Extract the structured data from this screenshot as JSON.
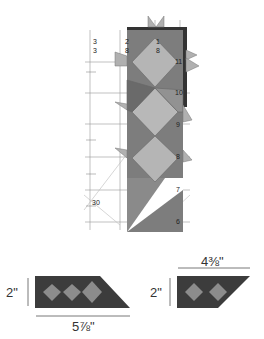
{
  "ruler": {
    "top_labels": [
      "3",
      "3",
      "2",
      "8",
      "1",
      "8"
    ],
    "scale_labels": [
      "11",
      "10",
      "9",
      "8",
      "7",
      "6"
    ],
    "angle_label": "30"
  },
  "piece_left": {
    "height_label": "2\"",
    "width_label": "5⅞\""
  },
  "piece_right": {
    "height_label": "2\"",
    "width_label": "4⅜\""
  },
  "colors": {
    "dark": "#3a3a3a",
    "mid": "#5c5c5c",
    "light": "#9a9a9a",
    "strip": "#7a7a7a",
    "strip_light": "#b8b8b8"
  }
}
